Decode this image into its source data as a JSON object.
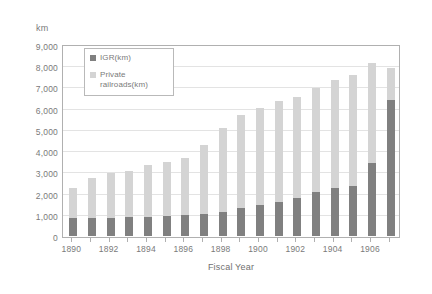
{
  "chart_data": {
    "type": "bar",
    "subtype": "stacked-bar",
    "title": "",
    "xlabel": "Fiscal Year",
    "ylabel": "km",
    "y_unit_label": "km",
    "ylim": [
      0,
      9000
    ],
    "ytick_step": 1000,
    "grid": true,
    "legend_position": "inside-top-left",
    "categories": [
      "1890",
      "1891",
      "1892",
      "1893",
      "1894",
      "1895",
      "1896",
      "1897",
      "1898",
      "1899",
      "1900",
      "1901",
      "1902",
      "1903",
      "1904",
      "1905",
      "1906",
      "1907"
    ],
    "xtick_labels": [
      "1890",
      "1892",
      "1894",
      "1896",
      "1898",
      "1900",
      "1902",
      "1904",
      "1906"
    ],
    "ytick_labels": [
      "0",
      "1,000",
      "2,000",
      "3,000",
      "4,000",
      "5,000",
      "6,000",
      "7,000",
      "8,000",
      "9,000"
    ],
    "ytick_values": [
      0,
      1000,
      2000,
      3000,
      4000,
      5000,
      6000,
      7000,
      8000,
      9000
    ],
    "series": [
      {
        "name": "IGR(km)",
        "color": "#808080",
        "values": [
          870,
          870,
          870,
          880,
          890,
          930,
          980,
          1040,
          1150,
          1310,
          1440,
          1620,
          1810,
          2060,
          2240,
          2360,
          3460,
          6400
        ]
      },
      {
        "name": "Private railroads(km)",
        "color": "#d4d4d4",
        "values": [
          1380,
          1850,
          2110,
          2180,
          2440,
          2580,
          2710,
          3240,
          3930,
          4370,
          4570,
          4740,
          4760,
          4900,
          5090,
          5230,
          4680,
          1500
        ]
      }
    ],
    "totals": [
      2250,
      2720,
      2980,
      3060,
      3330,
      3510,
      3690,
      4280,
      5080,
      5680,
      6010,
      6360,
      6570,
      6960,
      7330,
      7590,
      8140,
      7900
    ]
  },
  "colors": {
    "igr": "#808080",
    "private": "#d4d4d4",
    "grid": "#e3e3e3",
    "frame": "#b0b0b0",
    "text": "#7a7a7a",
    "background": "#ffffff"
  },
  "legend": {
    "items": [
      {
        "label": "IGR(km)",
        "color": "#808080"
      },
      {
        "label": "Private railroads(km)",
        "color": "#d4d4d4"
      }
    ]
  }
}
